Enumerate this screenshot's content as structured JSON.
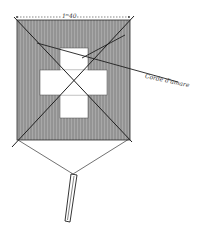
{
  "figure": {
    "dimension_label": "1ᵐ40",
    "rope_label": "Corde d'amare",
    "colors": {
      "background": "#ffffff",
      "sail_fill": "#a3a3a3",
      "hatch": "#7e7e7e",
      "line": "#2a2a2a",
      "cross_fill": "#ffffff"
    },
    "parts": [
      "square-sail",
      "white-cross",
      "diagonal-spars",
      "bridle-lines",
      "tail",
      "mooring-rope",
      "dimension-line"
    ]
  }
}
